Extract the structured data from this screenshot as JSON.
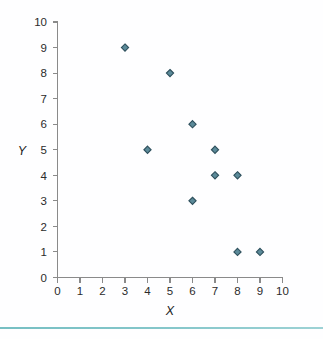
{
  "chart_data": {
    "type": "scatter",
    "title": "",
    "subtitle": "",
    "xlabel": "X",
    "ylabel": "Y",
    "xlim": [
      0,
      10
    ],
    "ylim": [
      0,
      10
    ],
    "xticks": [
      0,
      1,
      2,
      3,
      4,
      5,
      6,
      7,
      8,
      9,
      10
    ],
    "yticks": [
      0,
      1,
      2,
      3,
      4,
      5,
      6,
      7,
      8,
      9,
      10
    ],
    "xtick_labels": [
      "0",
      "1",
      "2",
      "3",
      "4",
      "5",
      "6",
      "7",
      "8",
      "9",
      "10"
    ],
    "ytick_labels": [
      "0",
      "1",
      "2",
      "3",
      "4",
      "5",
      "6",
      "7",
      "8",
      "9",
      "10"
    ],
    "grid": false,
    "legend": false,
    "legend_position": "none",
    "marker": "diamond",
    "marker_fill": "#5b8a99",
    "marker_edge": "#2d4f5c",
    "points": [
      {
        "x": 3,
        "y": 9
      },
      {
        "x": 4,
        "y": 5
      },
      {
        "x": 5,
        "y": 8
      },
      {
        "x": 6,
        "y": 6
      },
      {
        "x": 6,
        "y": 3
      },
      {
        "x": 7,
        "y": 5
      },
      {
        "x": 7,
        "y": 4
      },
      {
        "x": 8,
        "y": 4
      },
      {
        "x": 8,
        "y": 1
      },
      {
        "x": 9,
        "y": 1
      }
    ],
    "x": [
      3,
      4,
      5,
      6,
      6,
      7,
      7,
      8,
      8,
      9
    ],
    "values": [
      9,
      5,
      8,
      6,
      3,
      5,
      4,
      4,
      1,
      1
    ]
  },
  "figure": {
    "background_color": "#fefeff",
    "axis_color": "#8a8a8a",
    "footer_rule_color": "#7cc1c4"
  }
}
